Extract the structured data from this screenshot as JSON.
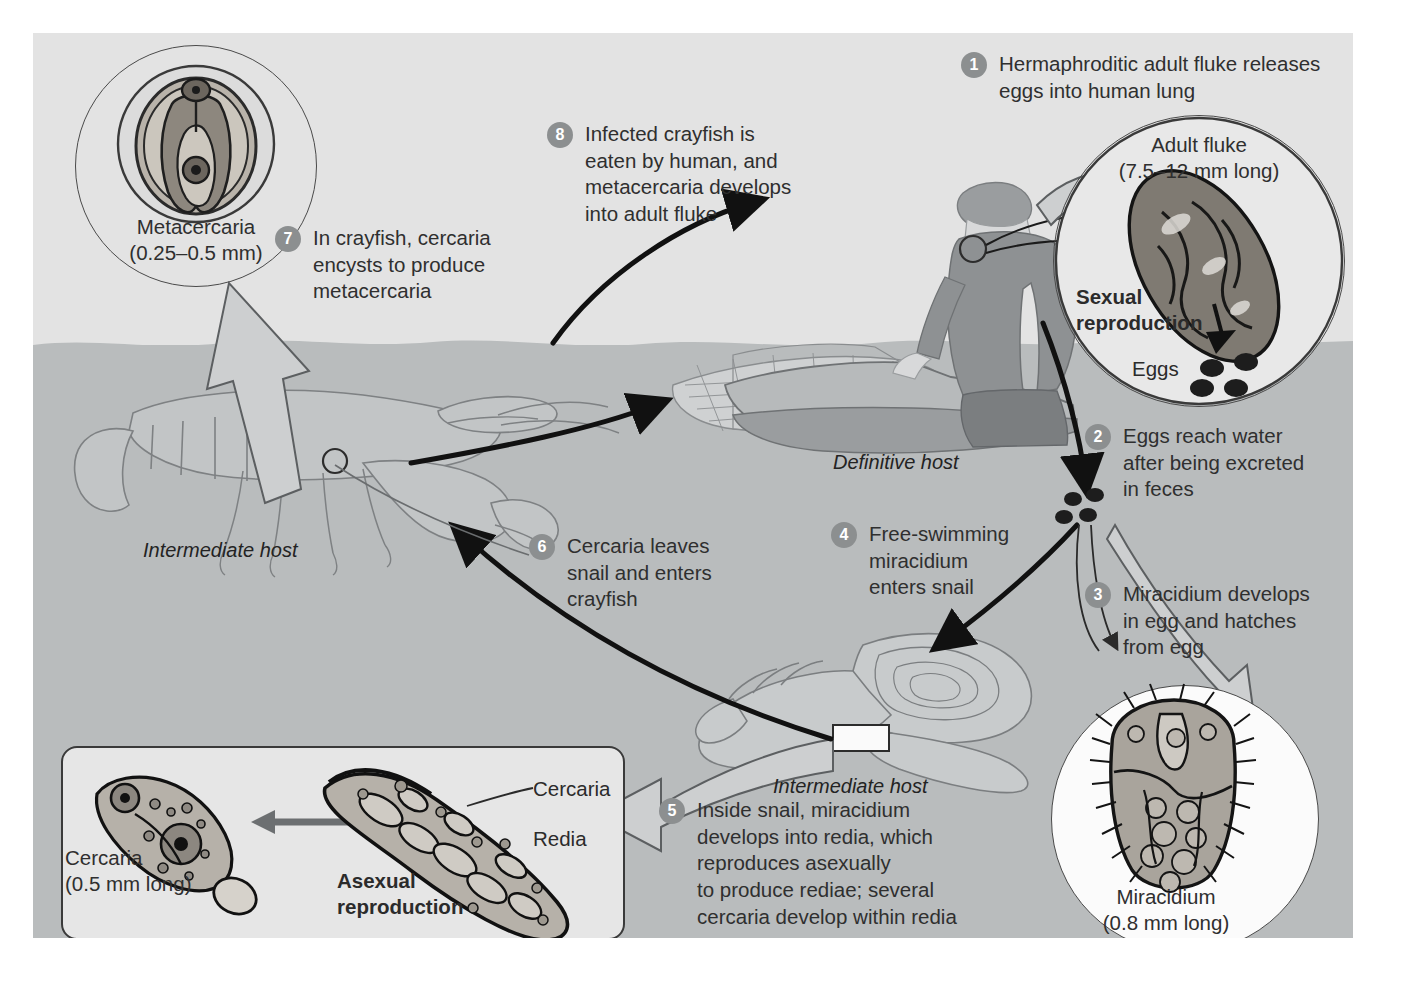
{
  "diagram": {
    "background_outer": "#ffffff",
    "background_air": "#e3e3e3",
    "background_water": "#b9bcbd",
    "step_badge_color": "#8c8f90",
    "text_color": "#2f2f2f"
  },
  "steps": [
    {
      "num": "1",
      "text": "Hermaphroditic adult fluke releases\neggs into human lung"
    },
    {
      "num": "2",
      "text": "Eggs reach water\nafter being excreted\nin feces"
    },
    {
      "num": "3",
      "text": "Miracidium develops\nin egg and hatches\nfrom egg"
    },
    {
      "num": "4",
      "text": "Free-swimming\nmiracidium\nenters snail"
    },
    {
      "num": "5",
      "text": "Inside snail, miracidium\ndevelops into redia, which\nreproduces asexually\nto produce rediae; several\ncercaria develop within redia"
    },
    {
      "num": "6",
      "text": "Cercaria leaves\nsnail and enters\ncrayfish"
    },
    {
      "num": "7",
      "text": "In crayfish, cercaria\nencysts to produce\nmetacercaria"
    },
    {
      "num": "8",
      "text": "Infected crayfish is\neaten by human, and\nmetacercaria develops\ninto adult fluke"
    }
  ],
  "insets": {
    "metacercaria": {
      "name": "Metacercaria",
      "size": "(0.25–0.5 mm)"
    },
    "adult_fluke": {
      "name": "Adult fluke",
      "size": "(7.5–12 mm long)",
      "repro": "Sexual\nreproduction",
      "eggs_label": "Eggs"
    },
    "miracidium": {
      "name": "Miracidium",
      "size": "(0.8 mm long)"
    },
    "cercaria": {
      "name": "Cercaria",
      "size": "(0.5 mm long)"
    }
  },
  "asexual_box": {
    "repro": "Asexual\nreproduction",
    "cercaria_label": "Cercaria",
    "redia_label": "Redia"
  },
  "host_labels": {
    "crayfish": "Intermediate host",
    "human": "Definitive host",
    "snail": "Intermediate host"
  }
}
